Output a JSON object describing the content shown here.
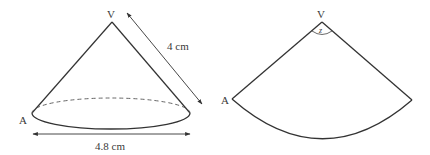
{
  "cone": {
    "apex_label": "V",
    "base_point_label": "A",
    "slant_height_label": "4 cm",
    "diameter_label": "4.8 cm"
  },
  "net": {
    "apex_label": "V",
    "edge_point_label": "A",
    "angle_label": "z"
  },
  "colors": {
    "stroke": "#333333",
    "text": "#3a3a3a",
    "background": "#ffffff"
  }
}
